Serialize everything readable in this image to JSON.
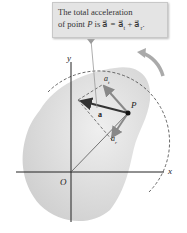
{
  "callout": {
    "line1": "The total acceleration",
    "line2": "of point P is a = a_t + a_r."
  },
  "labels": {
    "y_axis": "y",
    "x_axis": "x",
    "origin": "O",
    "point": "P",
    "tangential": "a_t",
    "radial": "a_r",
    "total": "a"
  },
  "colors": {
    "body_fill": "#dcdcdc",
    "vector_dark": "#333333",
    "vector_gray": "#8a8a8a",
    "callout_bg": "#e4e4e4"
  }
}
